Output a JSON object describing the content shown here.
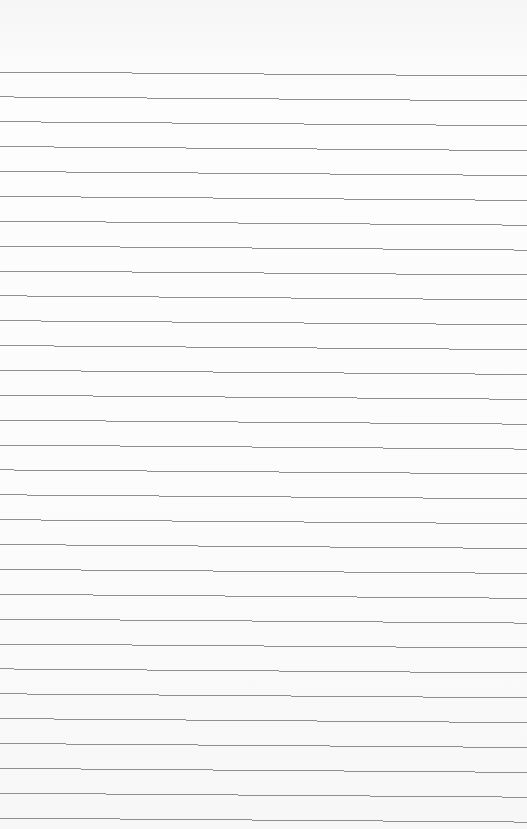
{
  "document": {
    "type": "lined-paper",
    "background_color": "#fbfbfb",
    "line_color": "#8f8f8f",
    "line_count": 31,
    "first_line_y": 72,
    "line_spacing": 24.87,
    "line_slope_px": 4,
    "text": ""
  }
}
